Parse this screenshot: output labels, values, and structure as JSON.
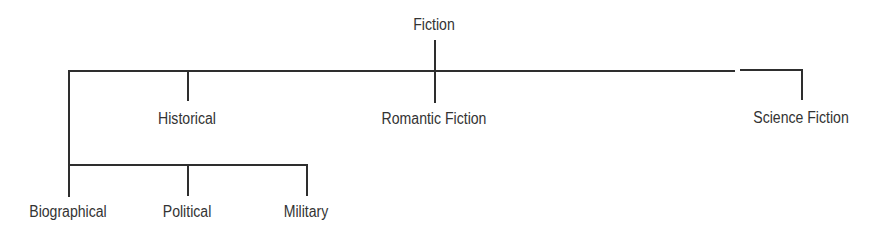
{
  "tree": {
    "root": {
      "label": "Fiction"
    },
    "level1": [
      {
        "label": "Historical"
      },
      {
        "label": "Romantic Fiction"
      },
      {
        "label": "Science Fiction"
      }
    ],
    "level2": [
      {
        "label": "Biographical"
      },
      {
        "label": "Political"
      },
      {
        "label": "Military"
      }
    ]
  },
  "colors": {
    "line": "#2e2e2e",
    "text": "#333333",
    "background": "#ffffff"
  }
}
